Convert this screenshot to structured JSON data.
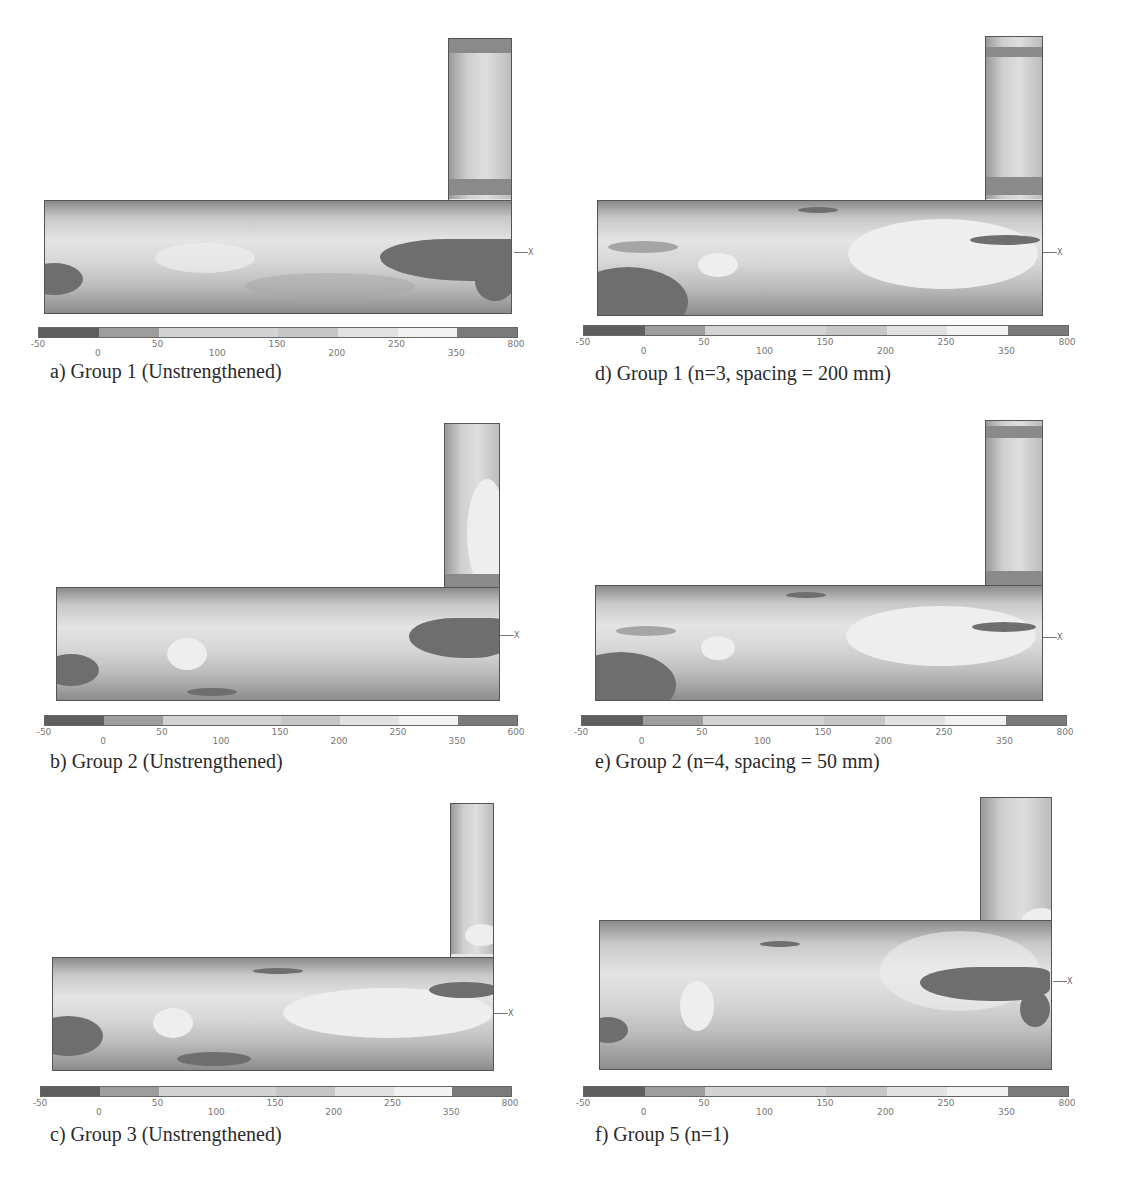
{
  "figure": {
    "colorbar": {
      "segments": [
        {
          "from": "-50",
          "to": "0",
          "color": "#5e5e5e"
        },
        {
          "from": "0",
          "to": "50",
          "color": "#9d9d9d"
        },
        {
          "from": "50",
          "to": "150",
          "color": "#d3d3d3"
        },
        {
          "from": "150",
          "to": "200",
          "color": "#c6c6c6"
        },
        {
          "from": "200",
          "to": "250",
          "color": "#e2e2e2"
        },
        {
          "from": "250",
          "to": "350",
          "color": "#f2f2f2"
        },
        {
          "from": "350",
          "to": "800",
          "color": "#7a7a7a"
        }
      ],
      "tick_labels": [
        "-50",
        "0",
        "50",
        "100",
        "150",
        "200",
        "250",
        "350",
        "800"
      ]
    },
    "axis_triad": {
      "x_label": "X",
      "mx_label": "MX"
    },
    "panels": [
      {
        "id": "a",
        "caption": "a) Group 1 (Unstrengthened)",
        "colorbar_max_label": "800"
      },
      {
        "id": "b",
        "caption": "b) Group 2 (Unstrengthened)",
        "colorbar_max_label": "600"
      },
      {
        "id": "c",
        "caption": "c) Group 3 (Unstrengthened)",
        "colorbar_max_label": "800"
      },
      {
        "id": "d",
        "caption": "d) Group 1 (n=3, spacing = 200 mm)",
        "colorbar_max_label": "800"
      },
      {
        "id": "e",
        "caption": "e) Group 2 (n=4, spacing = 50 mm)",
        "colorbar_max_label": "800"
      },
      {
        "id": "f",
        "caption": "f) Group 5 (n=1)",
        "colorbar_max_label": "800"
      }
    ]
  }
}
